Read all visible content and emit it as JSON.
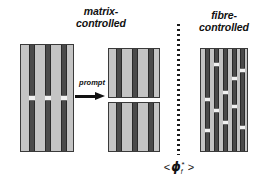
{
  "figure": {
    "title_left": "matrix-\ncontrolled",
    "title_right": "fibre-\ncontrolled",
    "prompt_label": "prompt",
    "arrow_icon": "right-arrow-icon",
    "divider_icon": "vertical-dotted-divider",
    "axis_label": {
      "left_bracket": "<",
      "symbol": "ϕ",
      "subscript": "f",
      "superscript": "*",
      "right_bracket": ">"
    },
    "colors": {
      "matrix": "#c4c4c4",
      "fibre": "#4a4a4a",
      "fibre_edge": "#2a2a2a",
      "break": "#f2f2f2",
      "outline": "#3a3a3a",
      "text": "#111111",
      "background": "#ffffff"
    }
  },
  "chart_data": {
    "type": "diagram",
    "xlabel": "< ϕf* >",
    "regimes": [
      {
        "name": "matrix-controlled",
        "side": "left",
        "panels": [
          "before",
          "after"
        ]
      },
      {
        "name": "fibre-controlled",
        "side": "right",
        "panels": [
          "broken"
        ]
      }
    ],
    "panels": [
      {
        "id": "left-before",
        "label": "matrix-controlled before prompt",
        "x": 20,
        "y": 44,
        "width": 54,
        "height": 108,
        "split": false,
        "fibres": [
          {
            "x": 8,
            "width": 6,
            "breaks": [
              {
                "y": 50,
                "height": 6
              }
            ]
          },
          {
            "x": 24,
            "width": 6,
            "breaks": [
              {
                "y": 50,
                "height": 6
              }
            ]
          },
          {
            "x": 40,
            "width": 6,
            "breaks": [
              {
                "y": 50,
                "height": 6
              }
            ]
          }
        ]
      },
      {
        "id": "middle-after",
        "label": "matrix-controlled after prompt (split by matrix crack)",
        "x": 108,
        "y": 48,
        "width": 52,
        "height": 104,
        "split": true,
        "split_y": 50,
        "split_height": 4,
        "fibres": [
          {
            "x": 7,
            "width": 6,
            "breaks": []
          },
          {
            "x": 23,
            "width": 6,
            "breaks": []
          },
          {
            "x": 39,
            "width": 6,
            "breaks": []
          }
        ]
      },
      {
        "id": "right-fibre",
        "label": "fibre-controlled dispersed breaks",
        "x": 200,
        "y": 48,
        "width": 48,
        "height": 104,
        "split": false,
        "fibres": [
          {
            "x": 4,
            "width": 5,
            "breaks": [
              {
                "y": 48,
                "height": 5
              },
              {
                "y": 79,
                "height": 5
              }
            ]
          },
          {
            "x": 13,
            "width": 5,
            "breaks": [
              {
                "y": 13,
                "height": 5
              },
              {
                "y": 59,
                "height": 5
              }
            ]
          },
          {
            "x": 22,
            "width": 5,
            "breaks": [
              {
                "y": 41,
                "height": 5
              },
              {
                "y": 71,
                "height": 5
              }
            ]
          },
          {
            "x": 31,
            "width": 5,
            "breaks": [
              {
                "y": 27,
                "height": 5
              },
              {
                "y": 55,
                "height": 5
              }
            ]
          },
          {
            "x": 39,
            "width": 5,
            "breaks": [
              {
                "y": 19,
                "height": 5
              },
              {
                "y": 76,
                "height": 5
              }
            ]
          }
        ]
      }
    ]
  }
}
